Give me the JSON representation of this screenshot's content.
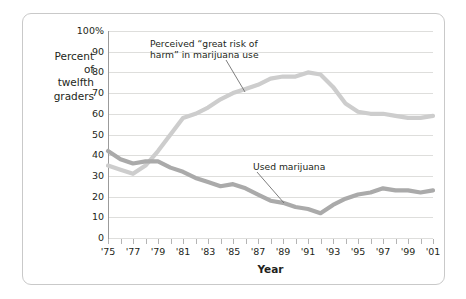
{
  "axis": {
    "y_title": "Percent\nof\ntwelfth\ngraders",
    "x_title": "Year",
    "y_ticks": [
      "100%",
      "90",
      "80",
      "70",
      "60",
      "50",
      "40",
      "30",
      "20",
      "10",
      "0"
    ],
    "x_ticks": [
      "'75",
      "'77",
      "'79",
      "'81",
      "'83",
      "'85",
      "'87",
      "'89",
      "'91",
      "'93",
      "'95",
      "'97",
      "'99",
      "'01"
    ]
  },
  "annotations": {
    "risk": "Perceived “great risk of\nharm” in marijuana use",
    "used": "Used marijuana"
  },
  "colors": {
    "risk_line": "#cdcdcd",
    "used_line": "#aaaaaa",
    "gridline": "#dededc",
    "axis": "#9b9b9b",
    "frame": "#c9c9c9",
    "text": "#231f20"
  },
  "chart_data": {
    "type": "line",
    "title": "",
    "subtitle": "",
    "xlabel": "Year",
    "ylabel": "Percent of twelfth graders",
    "xlim": [
      1975,
      2001
    ],
    "ylim": [
      0,
      100
    ],
    "grid": true,
    "legend": "annotations-on-plot",
    "x": [
      1975,
      1976,
      1977,
      1978,
      1979,
      1980,
      1981,
      1982,
      1983,
      1984,
      1985,
      1986,
      1987,
      1988,
      1989,
      1990,
      1991,
      1992,
      1993,
      1994,
      1995,
      1996,
      1997,
      1998,
      1999,
      2000,
      2001
    ],
    "series": [
      {
        "name": "Perceived “great risk of harm” in marijuana use",
        "color": "#cdcdcd",
        "values": [
          35,
          33,
          31,
          35,
          42,
          50,
          58,
          60,
          63,
          67,
          70,
          72,
          74,
          77,
          78,
          78,
          80,
          79,
          73,
          65,
          61,
          60,
          60,
          59,
          58,
          58,
          59
        ]
      },
      {
        "name": "Used marijuana",
        "color": "#aaaaaa",
        "values": [
          42,
          38,
          36,
          37,
          37,
          34,
          32,
          29,
          27,
          25,
          26,
          24,
          21,
          18,
          17,
          15,
          14,
          12,
          16,
          19,
          21,
          22,
          24,
          23,
          23,
          22,
          23
        ]
      }
    ]
  }
}
